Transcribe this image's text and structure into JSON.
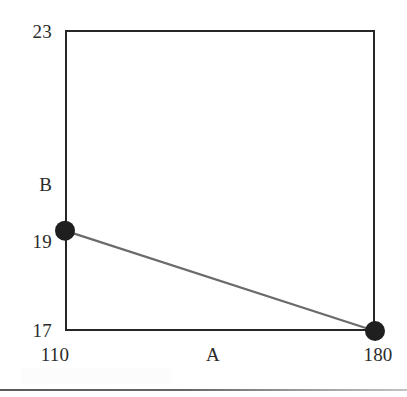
{
  "chart_data": {
    "type": "line",
    "title": "",
    "subtitle": "",
    "xlabel": "A",
    "ylabel": "B",
    "x": [
      110,
      180
    ],
    "values": [
      19,
      17
    ],
    "series": [
      {
        "name": "",
        "points": [
          {
            "x": 110,
            "y": 19
          },
          {
            "x": 180,
            "y": 17
          }
        ],
        "marker": "filled-circle",
        "marker_color": "#1f1f1f",
        "line_color": "#6b6b6b"
      }
    ],
    "xlim": [
      110,
      180
    ],
    "ylim": [
      17,
      23
    ],
    "xticks": [
      110,
      180
    ],
    "xticklabels": [
      "110",
      "180"
    ],
    "yticks": [
      17,
      19,
      23
    ],
    "yticklabels": [
      "17",
      "19",
      "23"
    ],
    "grid": false,
    "legend": false,
    "legend_position": "none",
    "frame": true,
    "annotations": []
  },
  "axes": {
    "y": {
      "title": "B",
      "tick_top": "23",
      "tick_mid": "19",
      "tick_bottom": "17"
    },
    "x": {
      "title": "A",
      "tick_left": "110",
      "tick_right": "180"
    }
  },
  "colors": {
    "frame": "#262626",
    "marker": "#1f1f1f",
    "line": "#6b6b6b",
    "text": "#2b2b2b",
    "background": "#ffffff"
  }
}
